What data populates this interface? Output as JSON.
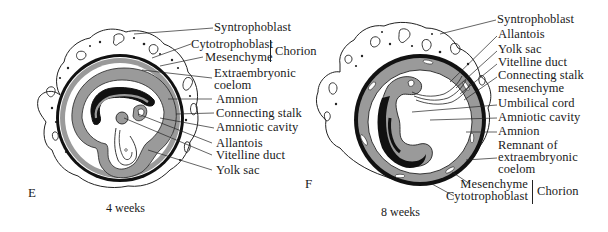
{
  "figure": {
    "type": "anatomical-diagram",
    "colors": {
      "ink": "#111111",
      "mesenchyme_gray": "#9a9a9a",
      "paper": "#ffffff"
    }
  },
  "panels": [
    {
      "id": "E",
      "letter": "E",
      "caption": "4 weeks",
      "labels": [
        {
          "text": "Syntrophoblast"
        },
        {
          "text": "Cytotrophoblast"
        },
        {
          "text": "Mesenchyme"
        },
        {
          "text": "Chorion",
          "group": "Cytotrophoblast + Mesenchyme"
        },
        {
          "text": "Extraembryonic"
        },
        {
          "text": "coelom"
        },
        {
          "text": "Amnion"
        },
        {
          "text": "Connecting stalk"
        },
        {
          "text": "Amniotic cavity"
        },
        {
          "text": "Allantois"
        },
        {
          "text": "Vitelline duct"
        },
        {
          "text": "Yolk sac"
        }
      ]
    },
    {
      "id": "F",
      "letter": "F",
      "caption": "8 weeks",
      "labels": [
        {
          "text": "Syntrophoblast"
        },
        {
          "text": "Allantois"
        },
        {
          "text": "Yolk sac"
        },
        {
          "text": "Vitelline duct"
        },
        {
          "text": "Connecting stalk"
        },
        {
          "text": "mesenchyme"
        },
        {
          "text": "Umbilical cord"
        },
        {
          "text": "Amniotic cavity"
        },
        {
          "text": "Amnion"
        },
        {
          "text": "Remnant of"
        },
        {
          "text": "extraembryonic"
        },
        {
          "text": "coelom"
        },
        {
          "text": "Mesenchyme"
        },
        {
          "text": "Cytotrophoblast"
        },
        {
          "text": "Chorion",
          "group": "Mesenchyme + Cytotrophoblast"
        }
      ]
    }
  ]
}
